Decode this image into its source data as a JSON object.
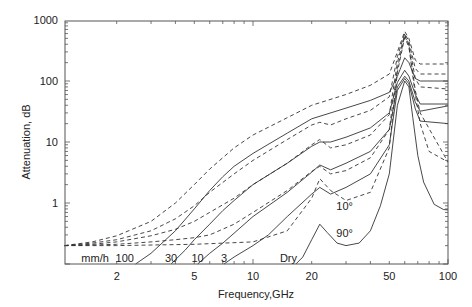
{
  "chart_data": {
    "type": "line",
    "title": "",
    "xlabel": "Frequency,GHz",
    "ylabel": "Attenuation, dB",
    "xscale": "log",
    "yscale": "log",
    "xlim": [
      1.08,
      100
    ],
    "ylim": [
      0.1,
      1000
    ],
    "x_ticks": [
      {
        "value": 2,
        "label": "2"
      },
      {
        "value": 5,
        "label": "5"
      },
      {
        "value": 10,
        "label": "10"
      },
      {
        "value": 20,
        "label": "20"
      },
      {
        "value": 50,
        "label": "50"
      },
      {
        "value": 100,
        "label": "100"
      }
    ],
    "y_ticks": [
      {
        "value": 1,
        "label": "1"
      },
      {
        "value": 10,
        "label": "10"
      },
      {
        "value": 100,
        "label": "100"
      },
      {
        "value": 1000,
        "label": "1000"
      }
    ],
    "grid": false,
    "legend": "none (inline annotations)",
    "annotations": [
      {
        "text": "mm/h",
        "f": 1.55,
        "a": 0.125
      },
      {
        "text": "100",
        "f": 2.2,
        "a": 0.125
      },
      {
        "text": "30",
        "f": 3.8,
        "a": 0.125
      },
      {
        "text": "10",
        "f": 5.2,
        "a": 0.125
      },
      {
        "text": "3",
        "f": 7.1,
        "a": 0.125
      },
      {
        "text": "Dry",
        "f": 15.2,
        "a": 0.125
      },
      {
        "text": "10°",
        "f": 29.5,
        "a": 0.88
      },
      {
        "text": "90°",
        "f": 29.5,
        "a": 0.32
      }
    ],
    "series": [
      {
        "name": "100 mm/h, 10° elevation",
        "style": "dashed",
        "points": [
          [
            1.08,
            0.2
          ],
          [
            1.5,
            0.23
          ],
          [
            2,
            0.29
          ],
          [
            3,
            0.5
          ],
          [
            4,
            1.0
          ],
          [
            5,
            2.0
          ],
          [
            6,
            3.6
          ],
          [
            8,
            8
          ],
          [
            10,
            13
          ],
          [
            15,
            25
          ],
          [
            20,
            40
          ],
          [
            30,
            60
          ],
          [
            40,
            85
          ],
          [
            50,
            130
          ],
          [
            55,
            300
          ],
          [
            60,
            650
          ],
          [
            63,
            500
          ],
          [
            68,
            220
          ],
          [
            72,
            190
          ],
          [
            100,
            190
          ]
        ]
      },
      {
        "name": "100 mm/h, 90° elevation",
        "style": "solid",
        "points": [
          [
            2.5,
            0.1
          ],
          [
            3,
            0.15
          ],
          [
            4,
            0.35
          ],
          [
            5,
            0.8
          ],
          [
            6,
            1.6
          ],
          [
            7,
            2.7
          ],
          [
            8,
            4
          ],
          [
            10,
            6.5
          ],
          [
            15,
            14
          ],
          [
            20,
            24
          ],
          [
            30,
            36
          ],
          [
            40,
            48
          ],
          [
            50,
            65
          ],
          [
            55,
            120
          ],
          [
            60,
            240
          ],
          [
            63,
            200
          ],
          [
            68,
            110
          ],
          [
            72,
            100
          ],
          [
            100,
            100
          ]
        ]
      },
      {
        "name": "30 mm/h, 10° elevation",
        "style": "dashed",
        "points": [
          [
            1.08,
            0.2
          ],
          [
            1.5,
            0.22
          ],
          [
            2,
            0.25
          ],
          [
            3,
            0.35
          ],
          [
            4,
            0.55
          ],
          [
            5,
            0.9
          ],
          [
            6,
            1.5
          ],
          [
            8,
            3
          ],
          [
            10,
            5
          ],
          [
            15,
            11
          ],
          [
            20,
            19
          ],
          [
            22,
            21
          ],
          [
            25,
            19
          ],
          [
            30,
            24
          ],
          [
            40,
            33
          ],
          [
            50,
            55
          ],
          [
            55,
            250
          ],
          [
            60,
            600
          ],
          [
            63,
            450
          ],
          [
            68,
            160
          ],
          [
            72,
            130
          ],
          [
            100,
            130
          ]
        ]
      },
      {
        "name": "30 mm/h, 90° elevation",
        "style": "solid",
        "points": [
          [
            3.8,
            0.1
          ],
          [
            4.5,
            0.17
          ],
          [
            5,
            0.25
          ],
          [
            6,
            0.45
          ],
          [
            7,
            0.75
          ],
          [
            8,
            1.1
          ],
          [
            10,
            2
          ],
          [
            15,
            4.5
          ],
          [
            20,
            8.5
          ],
          [
            22,
            10
          ],
          [
            25,
            10
          ],
          [
            30,
            12
          ],
          [
            40,
            17
          ],
          [
            50,
            30
          ],
          [
            55,
            95
          ],
          [
            60,
            150
          ],
          [
            63,
            120
          ],
          [
            68,
            60
          ],
          [
            72,
            42
          ],
          [
            100,
            42
          ]
        ]
      },
      {
        "name": "10 mm/h, 10° elevation",
        "style": "dashed",
        "points": [
          [
            1.08,
            0.2
          ],
          [
            1.5,
            0.21
          ],
          [
            2,
            0.23
          ],
          [
            3,
            0.29
          ],
          [
            4,
            0.37
          ],
          [
            5,
            0.5
          ],
          [
            6,
            0.7
          ],
          [
            8,
            1.2
          ],
          [
            10,
            2
          ],
          [
            15,
            4.5
          ],
          [
            20,
            9
          ],
          [
            22,
            11
          ],
          [
            25,
            8
          ],
          [
            30,
            9
          ],
          [
            40,
            13
          ],
          [
            50,
            28
          ],
          [
            55,
            200
          ],
          [
            60,
            580
          ],
          [
            63,
            400
          ],
          [
            68,
            110
          ],
          [
            72,
            80
          ],
          [
            100,
            74
          ]
        ]
      },
      {
        "name": "10 mm/h, 90° elevation",
        "style": "solid",
        "points": [
          [
            5.2,
            0.1
          ],
          [
            6,
            0.15
          ],
          [
            7,
            0.22
          ],
          [
            8,
            0.32
          ],
          [
            10,
            0.6
          ],
          [
            15,
            1.5
          ],
          [
            20,
            3.2
          ],
          [
            22,
            4.2
          ],
          [
            25,
            3.5
          ],
          [
            30,
            4.5
          ],
          [
            40,
            7
          ],
          [
            50,
            16
          ],
          [
            55,
            80
          ],
          [
            60,
            120
          ],
          [
            63,
            100
          ],
          [
            68,
            45
          ],
          [
            72,
            32
          ],
          [
            100,
            39
          ]
        ]
      },
      {
        "name": "3 mm/h, 10° elevation",
        "style": "dashed",
        "points": [
          [
            1.08,
            0.2
          ],
          [
            1.5,
            0.205
          ],
          [
            2,
            0.21
          ],
          [
            3,
            0.23
          ],
          [
            4,
            0.25
          ],
          [
            5,
            0.27
          ],
          [
            6,
            0.3
          ],
          [
            8,
            0.45
          ],
          [
            10,
            0.7
          ],
          [
            15,
            1.6
          ],
          [
            20,
            3.3
          ],
          [
            22,
            4
          ],
          [
            25,
            3
          ],
          [
            30,
            3.4
          ],
          [
            40,
            5.5
          ],
          [
            50,
            16
          ],
          [
            55,
            160
          ],
          [
            60,
            550
          ],
          [
            63,
            380
          ],
          [
            68,
            70
          ],
          [
            72,
            30
          ],
          [
            100,
            4.7
          ]
        ]
      },
      {
        "name": "3 mm/h, 90° elevation",
        "style": "solid",
        "points": [
          [
            7.1,
            0.1
          ],
          [
            8,
            0.13
          ],
          [
            10,
            0.2
          ],
          [
            12,
            0.3
          ],
          [
            15,
            0.6
          ],
          [
            20,
            1.4
          ],
          [
            22,
            1.8
          ],
          [
            25,
            1.4
          ],
          [
            30,
            1.8
          ],
          [
            40,
            3
          ],
          [
            50,
            9
          ],
          [
            55,
            70
          ],
          [
            60,
            110
          ],
          [
            63,
            90
          ],
          [
            68,
            35
          ],
          [
            72,
            22
          ],
          [
            100,
            20
          ]
        ]
      },
      {
        "name": "Dry, 10° elevation",
        "style": "dashed",
        "points": [
          [
            1.08,
            0.2
          ],
          [
            2,
            0.2
          ],
          [
            5,
            0.21
          ],
          [
            10,
            0.23
          ],
          [
            15,
            0.35
          ],
          [
            20,
            1.2
          ],
          [
            22,
            2.5
          ],
          [
            25,
            1.6
          ],
          [
            30,
            1.1
          ],
          [
            40,
            1.5
          ],
          [
            50,
            8
          ],
          [
            55,
            140
          ],
          [
            60,
            520
          ],
          [
            63,
            360
          ],
          [
            68,
            60
          ],
          [
            72,
            20
          ],
          [
            80,
            7
          ],
          [
            100,
            4.7
          ]
        ]
      },
      {
        "name": "Dry, 90° elevation",
        "style": "solid",
        "points": [
          [
            16.6,
            0.1
          ],
          [
            18,
            0.13
          ],
          [
            20,
            0.25
          ],
          [
            22,
            0.45
          ],
          [
            24,
            0.33
          ],
          [
            27,
            0.22
          ],
          [
            30,
            0.2
          ],
          [
            35,
            0.22
          ],
          [
            40,
            0.35
          ],
          [
            45,
            0.9
          ],
          [
            50,
            3
          ],
          [
            55,
            40
          ],
          [
            60,
            100
          ],
          [
            63,
            80
          ],
          [
            66,
            25
          ],
          [
            70,
            6
          ],
          [
            75,
            2.2
          ],
          [
            85,
            0.95
          ],
          [
            95,
            0.78
          ],
          [
            100,
            0.77
          ]
        ]
      }
    ]
  }
}
